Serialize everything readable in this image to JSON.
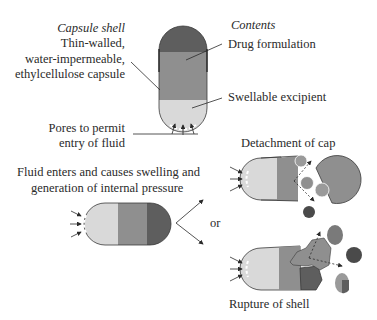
{
  "figure": {
    "top": {
      "capsule_shell_heading": "Capsule shell",
      "capsule_shell_lines": [
        "Thin-walled,",
        "water-impermeable,",
        "ethylcellulose capsule"
      ],
      "contents_heading": "Contents",
      "drug_formulation": "Drug formulation",
      "swellable_excipient": "Swellable excipient",
      "pores_lines": [
        "Pores to permit",
        "entry of fluid"
      ]
    },
    "middle": {
      "fluid_lines": [
        "Fluid enters and causes swelling and",
        "generation of internal pressure"
      ],
      "or_label": "or"
    },
    "outcomes": {
      "detachment_label": "Detachment of cap",
      "rupture_label": "Rupture of shell"
    },
    "colors": {
      "cap_dark": "#5e5e5e",
      "drug_mid": "#8f8f8f",
      "excipient_light": "#d9d9d9",
      "outline": "#3a3a3a",
      "particle_dark": "#4a4a4a",
      "particle_mid": "#7a7a7a",
      "particle_light": "#9a9a9a"
    }
  }
}
